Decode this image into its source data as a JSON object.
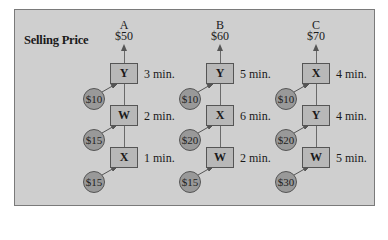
{
  "title": "Selling Price",
  "colors": {
    "panel": "#cfcfcf",
    "box": "#b8b8b8",
    "circle": "#999999",
    "border": "#555555"
  },
  "products": [
    {
      "name": "A",
      "price": "$50",
      "steps": [
        {
          "machine": "Y",
          "time": "3 min.",
          "cost": "$10"
        },
        {
          "machine": "W",
          "time": "2 min.",
          "cost": "$15"
        },
        {
          "machine": "X",
          "time": "1 min.",
          "cost": "$15"
        }
      ]
    },
    {
      "name": "B",
      "price": "$60",
      "steps": [
        {
          "machine": "Y",
          "time": "5 min.",
          "cost": "$10"
        },
        {
          "machine": "X",
          "time": "6 min.",
          "cost": "$20"
        },
        {
          "machine": "W",
          "time": "2 min.",
          "cost": "$15"
        }
      ]
    },
    {
      "name": "C",
      "price": "$70",
      "steps": [
        {
          "machine": "X",
          "time": "4 min.",
          "cost": "$10"
        },
        {
          "machine": "Y",
          "time": "4 min.",
          "cost": "$20"
        },
        {
          "machine": "W",
          "time": "5 min.",
          "cost": "$30"
        }
      ]
    }
  ]
}
